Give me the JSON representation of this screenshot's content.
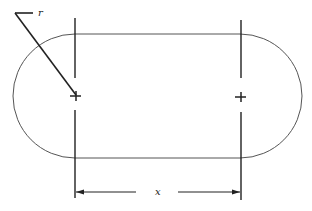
{
  "diagram": {
    "type": "slot / obround shape with dimensions",
    "labels": {
      "radius": "r",
      "center_distance": "x"
    },
    "colors": {
      "outline": "#555555",
      "construction": "#222222",
      "background": "#ffffff"
    },
    "geometry": {
      "left_center": [
        75,
        97
      ],
      "right_center": [
        240,
        97
      ],
      "radius": 62
    }
  }
}
